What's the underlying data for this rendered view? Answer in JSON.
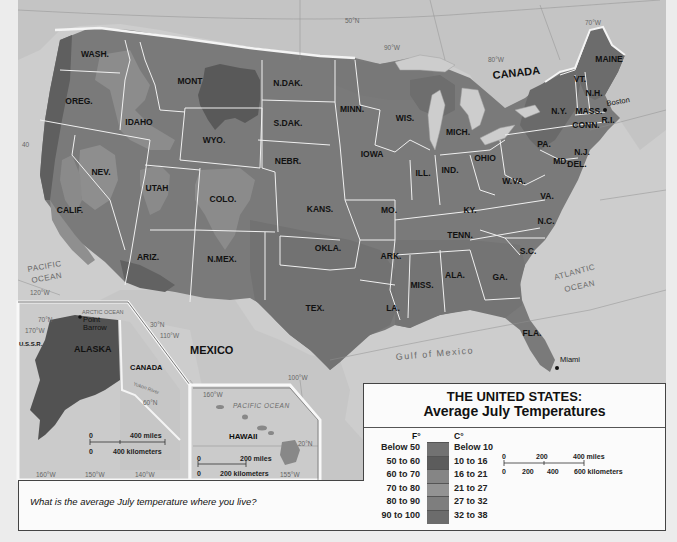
{
  "map": {
    "title_line1": "THE UNITED STATES:",
    "title_line2": "Average July Temperatures",
    "colors": {
      "below_50": "#6e6e6e",
      "50_60": "#5a5a5a",
      "60_70": "#8a8a8a",
      "70_80": "#9a9a9a",
      "80_90": "#7d7d7d",
      "90_100": "#6a6a6a",
      "water": "#cfcfcf",
      "land_foreign": "#c8c8c8",
      "state_border": "#f2f2f2"
    }
  },
  "legend": {
    "f_header": "F°",
    "c_header": "C°",
    "rows": [
      {
        "f": "Below 50",
        "c": "Below 10",
        "color": "#727272"
      },
      {
        "f": "50 to 60",
        "c": "10 to 16",
        "color": "#5c5c5c"
      },
      {
        "f": "60 to 70",
        "c": "16 to 21",
        "color": "#858585"
      },
      {
        "f": "70 to 80",
        "c": "21 to 27",
        "color": "#939393"
      },
      {
        "f": "80 to 90",
        "c": "27 to 32",
        "color": "#7e7e7e"
      },
      {
        "f": "90 to 100",
        "c": "32 to 38",
        "color": "#6c6c6c"
      }
    ],
    "scale": {
      "miles_0": "0",
      "miles_200": "200",
      "miles_400": "400 miles",
      "km_0": "0",
      "km_200": "200",
      "km_400": "400",
      "km_600": "600 kilometers"
    }
  },
  "states": [
    {
      "name": "WASH.",
      "x": 95,
      "y": 57
    },
    {
      "name": "OREG.",
      "x": 79,
      "y": 104
    },
    {
      "name": "IDAHO",
      "x": 139,
      "y": 125
    },
    {
      "name": "MONT",
      "x": 190,
      "y": 84
    },
    {
      "name": "WYO.",
      "x": 214,
      "y": 143
    },
    {
      "name": "N.DAK.",
      "x": 288,
      "y": 86
    },
    {
      "name": "S.DAK.",
      "x": 288,
      "y": 126
    },
    {
      "name": "NEBR.",
      "x": 288,
      "y": 164
    },
    {
      "name": "NEV.",
      "x": 101,
      "y": 175
    },
    {
      "name": "UTAH",
      "x": 157,
      "y": 191
    },
    {
      "name": "COLO.",
      "x": 223,
      "y": 202
    },
    {
      "name": "KANS.",
      "x": 320,
      "y": 212
    },
    {
      "name": "CALIF.",
      "x": 70,
      "y": 213
    },
    {
      "name": "ARIZ.",
      "x": 148,
      "y": 260
    },
    {
      "name": "N.MEX.",
      "x": 222,
      "y": 262
    },
    {
      "name": "OKLA.",
      "x": 328,
      "y": 251
    },
    {
      "name": "TEX.",
      "x": 315,
      "y": 311
    },
    {
      "name": "MINN.",
      "x": 352,
      "y": 112
    },
    {
      "name": "WIS.",
      "x": 405,
      "y": 121
    },
    {
      "name": "IOWA",
      "x": 372,
      "y": 157
    },
    {
      "name": "MICH.",
      "x": 458,
      "y": 135
    },
    {
      "name": "ILL.",
      "x": 423,
      "y": 176
    },
    {
      "name": "IND.",
      "x": 450,
      "y": 173
    },
    {
      "name": "OHIO",
      "x": 485,
      "y": 161
    },
    {
      "name": "MO.",
      "x": 389,
      "y": 213
    },
    {
      "name": "ARK.",
      "x": 391,
      "y": 259
    },
    {
      "name": "KY.",
      "x": 470,
      "y": 213
    },
    {
      "name": "TENN.",
      "x": 460,
      "y": 238
    },
    {
      "name": "MISS.",
      "x": 422,
      "y": 288
    },
    {
      "name": "ALA.",
      "x": 455,
      "y": 278
    },
    {
      "name": "LA.",
      "x": 393,
      "y": 311
    },
    {
      "name": "GA.",
      "x": 500,
      "y": 280
    },
    {
      "name": "FLA.",
      "x": 532,
      "y": 336
    },
    {
      "name": "S.C.",
      "x": 528,
      "y": 254
    },
    {
      "name": "N.C.",
      "x": 546,
      "y": 224
    },
    {
      "name": "VA.",
      "x": 547,
      "y": 199
    },
    {
      "name": "W.VA.",
      "x": 514,
      "y": 184
    },
    {
      "name": "PA.",
      "x": 544,
      "y": 147
    },
    {
      "name": "N.Y.",
      "x": 559,
      "y": 114
    },
    {
      "name": "MD.",
      "x": 561,
      "y": 164
    },
    {
      "name": "DEL.",
      "x": 577,
      "y": 167
    },
    {
      "name": "N.J.",
      "x": 582,
      "y": 155
    },
    {
      "name": "CONN.",
      "x": 586,
      "y": 128
    },
    {
      "name": "MASS.",
      "x": 589,
      "y": 114
    },
    {
      "name": "R.I.",
      "x": 608,
      "y": 123
    },
    {
      "name": "VT.",
      "x": 580,
      "y": 82
    },
    {
      "name": "N.H.",
      "x": 594,
      "y": 96
    },
    {
      "name": "MAINE",
      "x": 609,
      "y": 62
    }
  ],
  "places": {
    "canada": "CANADA",
    "mexico": "MEXICO",
    "pacific": [
      "PACIFIC",
      "OCEAN"
    ],
    "atlantic": [
      "ATLANTIC",
      "OCEAN"
    ],
    "gulf": "Gulf of Mexico",
    "boston": "Boston",
    "miami": "Miami"
  },
  "coordinates": {
    "n50": "50°N",
    "w90": "90°W",
    "w80": "80°W",
    "w70": "70°W",
    "w120": "120°W",
    "n30": "30°N",
    "w110": "110°W",
    "w100": "100°W",
    "n40": "40"
  },
  "alaska_inset": {
    "label": "ALASKA",
    "canada": "CANADA",
    "ussr": "U.S.S.R.",
    "arctic": "ARCTIC OCEAN",
    "point_barrow": [
      "Point",
      "Barrow"
    ],
    "n70": "70°N",
    "w170": "170°W",
    "n60": "60°N",
    "w160": "160°W",
    "w150": "150°W",
    "w140": "140°W",
    "yukon": "Yukon River",
    "scale": {
      "m0": "0",
      "miles": "400 miles",
      "k0": "0",
      "km": "400 kilometers"
    }
  },
  "hawaii_inset": {
    "label": "HAWAII",
    "pacific": "PACIFIC OCEAN",
    "w160": "160°W",
    "n20": "20°N",
    "w155": "155°W",
    "scale": {
      "m0": "0",
      "miles": "200 miles",
      "k0": "0",
      "km": "200 kilometers"
    }
  },
  "question": "What is the average July temperature where you live?"
}
